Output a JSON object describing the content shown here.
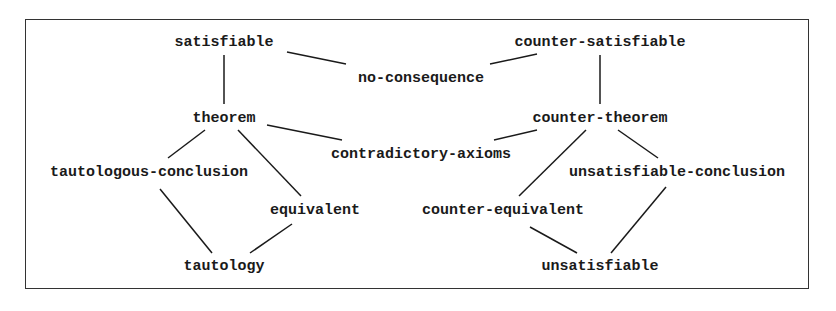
{
  "diagram": {
    "nodes": [
      {
        "id": "satisfiable",
        "label": "satisfiable",
        "x": 224,
        "y": 42
      },
      {
        "id": "counter-satisfiable",
        "label": "counter-satisfiable",
        "x": 600,
        "y": 42
      },
      {
        "id": "no-consequence",
        "label": "no-consequence",
        "x": 421,
        "y": 78
      },
      {
        "id": "theorem",
        "label": "theorem",
        "x": 224,
        "y": 118
      },
      {
        "id": "counter-theorem",
        "label": "counter-theorem",
        "x": 600,
        "y": 118
      },
      {
        "id": "contradictory-axioms",
        "label": "contradictory-axioms",
        "x": 421,
        "y": 154
      },
      {
        "id": "tautologous-conclusion",
        "label": "tautologous-conclusion",
        "x": 149,
        "y": 172
      },
      {
        "id": "unsatisfiable-conclusion",
        "label": "unsatisfiable-conclusion",
        "x": 677,
        "y": 172
      },
      {
        "id": "equivalent",
        "label": "equivalent",
        "x": 315,
        "y": 210
      },
      {
        "id": "counter-equivalent",
        "label": "counter-equivalent",
        "x": 503,
        "y": 210
      },
      {
        "id": "tautology",
        "label": "tautology",
        "x": 224,
        "y": 266
      },
      {
        "id": "unsatisfiable",
        "label": "unsatisfiable",
        "x": 600,
        "y": 266
      }
    ],
    "edges": [
      {
        "from": "satisfiable",
        "to": "theorem",
        "x1": 224,
        "y1": 55,
        "x2": 224,
        "y2": 104
      },
      {
        "from": "satisfiable",
        "to": "no-consequence",
        "x1": 287,
        "y1": 52,
        "x2": 346,
        "y2": 64
      },
      {
        "from": "counter-satisfiable",
        "to": "no-consequence",
        "x1": 537,
        "y1": 54,
        "x2": 490,
        "y2": 64
      },
      {
        "from": "counter-satisfiable",
        "to": "counter-theorem",
        "x1": 600,
        "y1": 55,
        "x2": 600,
        "y2": 104
      },
      {
        "from": "theorem",
        "to": "contradictory-axioms",
        "x1": 267,
        "y1": 125,
        "x2": 342,
        "y2": 140
      },
      {
        "from": "counter-theorem",
        "to": "contradictory-axioms",
        "x1": 537,
        "y1": 130,
        "x2": 494,
        "y2": 140
      },
      {
        "from": "theorem",
        "to": "tautologous-conclusion",
        "x1": 205,
        "y1": 130,
        "x2": 168,
        "y2": 158
      },
      {
        "from": "theorem",
        "to": "equivalent",
        "x1": 238,
        "y1": 130,
        "x2": 301,
        "y2": 196
      },
      {
        "from": "counter-theorem",
        "to": "counter-equivalent",
        "x1": 586,
        "y1": 130,
        "x2": 519,
        "y2": 196
      },
      {
        "from": "counter-theorem",
        "to": "unsatisfiable-conclusion",
        "x1": 618,
        "y1": 130,
        "x2": 658,
        "y2": 158
      },
      {
        "from": "tautologous-conclusion",
        "to": "tautology",
        "x1": 160,
        "y1": 189,
        "x2": 212,
        "y2": 253
      },
      {
        "from": "equivalent",
        "to": "tautology",
        "x1": 292,
        "y1": 224,
        "x2": 250,
        "y2": 253
      },
      {
        "from": "counter-equivalent",
        "to": "unsatisfiable",
        "x1": 530,
        "y1": 227,
        "x2": 577,
        "y2": 253
      },
      {
        "from": "unsatisfiable-conclusion",
        "to": "unsatisfiable",
        "x1": 666,
        "y1": 187,
        "x2": 611,
        "y2": 253
      }
    ]
  }
}
